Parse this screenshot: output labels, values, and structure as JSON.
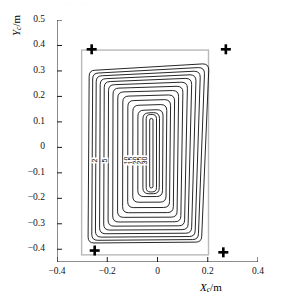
{
  "figure": {
    "title_faint": ". . . . . . . .",
    "marker_glyph": "plus-marker"
  },
  "axes": {
    "x": {
      "label_main": "X",
      "label_sub": "c",
      "label_unit": "/m",
      "ticks": [
        "−0.4",
        "−0.2",
        "0",
        "0.2",
        "0.4"
      ],
      "tick_values": [
        -0.4,
        -0.2,
        0,
        0.2,
        0.4
      ],
      "min": -0.4,
      "max": 0.4
    },
    "y": {
      "label_main": "Y",
      "label_sub": "c",
      "label_unit": "/m",
      "ticks": [
        "0.5",
        "0.4",
        "0.3",
        "0.2",
        "0.1",
        "0",
        "−0.1",
        "−0.2",
        "−0.3",
        "−0.4"
      ],
      "tick_values": [
        0.5,
        0.4,
        0.3,
        0.2,
        0.1,
        0,
        -0.1,
        -0.2,
        -0.3,
        -0.4
      ],
      "min": -0.45,
      "max": 0.5
    }
  },
  "chart_data": {
    "type": "contour",
    "title": "",
    "xlabel": "Xc/m",
    "ylabel": "Yc/m",
    "xlim": [
      -0.4,
      0.4
    ],
    "ylim": [
      -0.45,
      0.5
    ],
    "grid": false,
    "legend": "none",
    "contour_levels": [
      2,
      5,
      10,
      15,
      20,
      25,
      30
    ],
    "contour_labels": [
      "2",
      "5",
      "10",
      "15",
      "20",
      "25",
      "30"
    ],
    "contour_label_y": -0.055,
    "contour_label_x": [
      -0.235,
      -0.196,
      -0.118,
      -0.1,
      -0.082,
      -0.064,
      -0.046
    ],
    "boundary_rect": {
      "name": "coil-boundary",
      "x_min": -0.302,
      "x_max": 0.203,
      "y_min": -0.422,
      "y_max": 0.382,
      "color": "#b9b9b9"
    },
    "contours": [
      {
        "level": 30,
        "x_min": -0.272,
        "x_max": 0.176,
        "y_min": -0.372,
        "y_max": 0.318,
        "skew": 0.028
      },
      {
        "level": 25,
        "x_min": -0.258,
        "x_max": 0.163,
        "y_min": -0.362,
        "y_max": 0.305,
        "skew": 0.024
      },
      {
        "level": 20,
        "x_min": -0.244,
        "x_max": 0.15,
        "y_min": -0.35,
        "y_max": 0.292,
        "skew": 0.02
      },
      {
        "level": 15,
        "x_min": -0.228,
        "x_max": 0.136,
        "y_min": -0.337,
        "y_max": 0.279,
        "skew": 0.017
      },
      {
        "level": 10,
        "x_min": -0.212,
        "x_max": 0.122,
        "y_min": -0.323,
        "y_max": 0.266,
        "skew": 0.014
      },
      {
        "level": 5,
        "x_min": -0.195,
        "x_max": 0.108,
        "y_min": -0.308,
        "y_max": 0.252,
        "skew": 0.011
      },
      {
        "level": 2,
        "x_min": -0.177,
        "x_max": 0.093,
        "y_min": -0.292,
        "y_max": 0.237,
        "skew": 0.008
      },
      {
        "level": 2,
        "x_min": -0.158,
        "x_max": 0.078,
        "y_min": -0.274,
        "y_max": 0.221,
        "skew": 0.006
      },
      {
        "level": 2,
        "x_min": -0.138,
        "x_max": 0.063,
        "y_min": -0.256,
        "y_max": 0.204,
        "skew": 0.005
      },
      {
        "level": 2,
        "x_min": -0.118,
        "x_max": 0.048,
        "y_min": -0.236,
        "y_max": 0.186,
        "skew": 0.004
      },
      {
        "level": 2,
        "x_min": -0.098,
        "x_max": 0.034,
        "y_min": -0.215,
        "y_max": 0.167,
        "skew": 0.003
      },
      {
        "level": 2,
        "x_min": -0.078,
        "x_max": 0.02,
        "y_min": -0.193,
        "y_max": 0.147,
        "skew": 0.002
      },
      {
        "level": 2,
        "x_min": -0.058,
        "x_max": 0.007,
        "y_min": -0.182,
        "y_max": 0.136,
        "skew": 0.001
      },
      {
        "level": 2,
        "x_min": -0.045,
        "x_max": -0.004,
        "y_min": -0.175,
        "y_max": 0.129,
        "skew": 0.0
      }
    ],
    "markers": [
      {
        "name": "marker-top-left",
        "x": -0.262,
        "y": 0.385
      },
      {
        "name": "marker-top-right",
        "x": 0.272,
        "y": 0.385
      },
      {
        "name": "marker-bottom-left",
        "x": -0.25,
        "y": -0.405
      },
      {
        "name": "marker-bottom-right",
        "x": 0.262,
        "y": -0.412
      }
    ]
  }
}
